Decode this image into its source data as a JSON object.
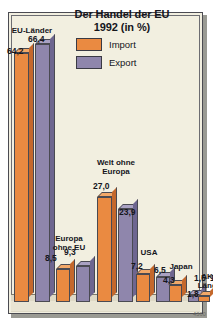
{
  "chart_data": {
    "type": "bar",
    "title": "Der Handel der EU",
    "subtitle": "1992 (in %)",
    "title_line1": "Der Handel der EU",
    "title_line2": "1992 (in %)",
    "xlabel": "",
    "ylabel": "",
    "ylim": [
      0,
      70
    ],
    "grid": false,
    "legend_position": "top-center",
    "categories": [
      "EU-Länder",
      "Europa ohne EU",
      "Welt ohne Europa",
      "USA",
      "Japan",
      "AKP-Länder"
    ],
    "category_lines": [
      [
        "EU-Länder"
      ],
      [
        "Europa",
        "ohne EU"
      ],
      [
        "Welt ohne",
        "Europa"
      ],
      [
        "USA"
      ],
      [
        "Japan"
      ],
      [
        "AKP-",
        "Länder"
      ]
    ],
    "series": [
      {
        "name": "Import",
        "color": "#ea8a41",
        "values": [
          64.2,
          8.5,
          27.0,
          7.2,
          4.3,
          1.5
        ],
        "value_labels": [
          "64,2",
          "8,5",
          "27,0",
          "7,2",
          "4,3",
          "1,5"
        ]
      },
      {
        "name": "Export",
        "color": "#8f86ac",
        "values": [
          66.4,
          9.3,
          23.9,
          6.5,
          1.8,
          1.5
        ],
        "value_labels": [
          "66,4",
          "9,3",
          "23,9",
          "6,5",
          "1,8",
          "1,5"
        ]
      }
    ]
  },
  "legend": {
    "import_label": "Import",
    "export_label": "Export"
  },
  "footer": {
    "code": "4360"
  }
}
